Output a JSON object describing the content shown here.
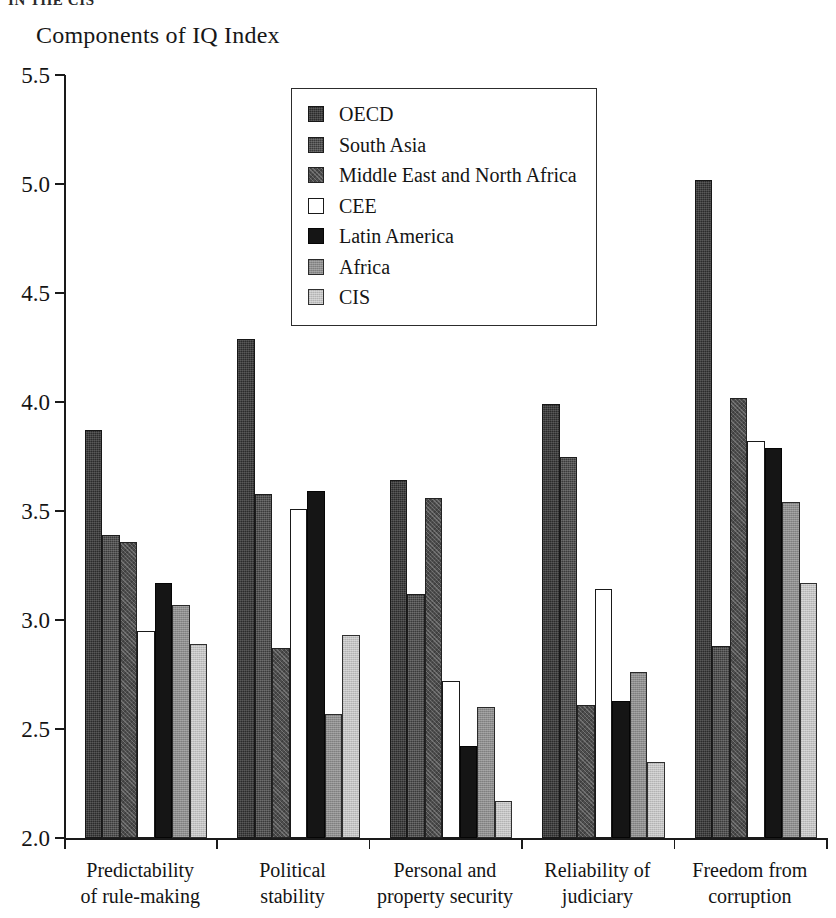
{
  "page": {
    "cut_off_header": "IN THE CIS"
  },
  "chart_data": {
    "type": "bar",
    "title": "Components of IQ Index",
    "xlabel": "",
    "ylabel": "",
    "ylim": [
      2.0,
      5.5
    ],
    "ytick_labels": [
      "5.5",
      "5.0",
      "4.5",
      "4.0",
      "3.5",
      "3.0",
      "2.5",
      "2.0"
    ],
    "ytick_values": [
      5.5,
      5.0,
      4.5,
      4.0,
      3.5,
      3.0,
      2.5,
      2.0
    ],
    "grid": false,
    "legend_position": "top-center",
    "categories": [
      "Predictability\nof rule-making",
      "Political\nstability",
      "Personal and\nproperty security",
      "Reliability of\njudiciary",
      "Freedom from\ncorruption"
    ],
    "series": [
      {
        "name": "OECD",
        "color": "#2b2b2b",
        "values": [
          3.87,
          4.29,
          3.64,
          3.99,
          5.02
        ]
      },
      {
        "name": "South Asia",
        "color": "#3a3a3a",
        "values": [
          3.39,
          3.58,
          3.12,
          3.75,
          2.88
        ]
      },
      {
        "name": "Middle East and North Africa",
        "color": "#4d4d4d",
        "values": [
          3.36,
          2.87,
          3.56,
          2.61,
          4.02
        ]
      },
      {
        "name": "CEE",
        "color": "#ffffff",
        "values": [
          2.95,
          3.51,
          2.72,
          3.14,
          3.82
        ]
      },
      {
        "name": "Latin America",
        "color": "#151515",
        "values": [
          3.17,
          3.59,
          2.42,
          2.63,
          3.79
        ]
      },
      {
        "name": "Africa",
        "color": "#8d8d8d",
        "values": [
          3.07,
          2.57,
          2.6,
          2.76,
          3.54
        ]
      },
      {
        "name": "CIS",
        "color": "#c2c2c2",
        "values": [
          2.89,
          2.93,
          2.17,
          2.35,
          3.17
        ]
      }
    ]
  }
}
